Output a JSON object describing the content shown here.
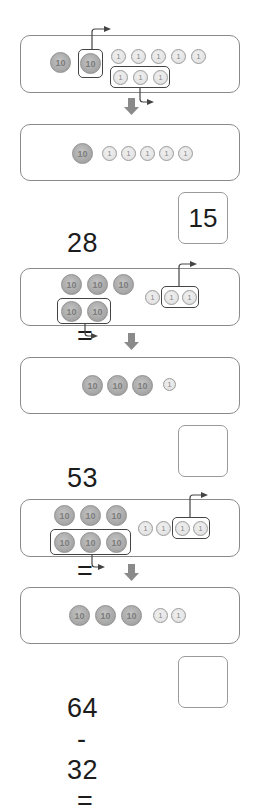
{
  "problems": [
    {
      "minuend": "28",
      "operator": "-",
      "subtrahend": "13",
      "equals": "=",
      "answer": "15",
      "before": {
        "tens": 2,
        "ones": 8,
        "tens_taken": 1,
        "ones_taken": 3
      },
      "after": {
        "tens": 1,
        "ones": 5
      }
    },
    {
      "minuend": "53",
      "operator": "-",
      "subtrahend": "22",
      "equals": "=",
      "answer": "",
      "before": {
        "tens": 5,
        "ones": 3,
        "tens_taken": 2,
        "ones_taken": 2
      },
      "after": {
        "tens": 3,
        "ones": 1
      }
    },
    {
      "minuend": "64",
      "operator": "-",
      "subtrahend": "32",
      "equals": "=",
      "answer": "",
      "before": {
        "tens": 6,
        "ones": 4,
        "tens_taken": 3,
        "ones_taken": 2
      },
      "after": {
        "tens": 3,
        "ones": 2
      }
    }
  ],
  "coin_labels": {
    "ten": "10",
    "one": "1"
  },
  "colors": {
    "panel_border": "#8a8a8a",
    "group_border": "#444444",
    "coin10": "#a9a9a9",
    "coin1": "#e6e6e6",
    "arrow": "#888888",
    "text": "#1c1c1c"
  }
}
